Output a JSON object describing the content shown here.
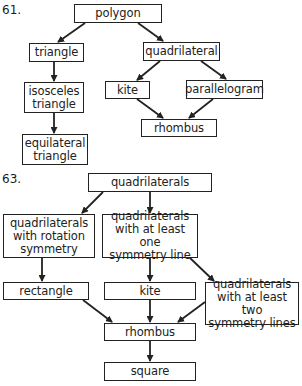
{
  "diagrams": [
    {
      "number": "61.",
      "nodes": {
        "polygon": "polygon",
        "triangle": "triangle",
        "quadrilateral": "quadrilateral",
        "isosceles_triangle": "isosceles\ntriangle",
        "kite": "kite",
        "parallelogram": "parallelogram",
        "rhombus": "rhombus",
        "equilateral_triangle": "equilateral\ntriangle"
      },
      "edges": [
        [
          "polygon",
          "triangle"
        ],
        [
          "polygon",
          "quadrilateral"
        ],
        [
          "triangle",
          "isosceles_triangle"
        ],
        [
          "isosceles_triangle",
          "equilateral_triangle"
        ],
        [
          "quadrilateral",
          "kite"
        ],
        [
          "quadrilateral",
          "parallelogram"
        ],
        [
          "kite",
          "rhombus"
        ],
        [
          "parallelogram",
          "rhombus"
        ]
      ]
    },
    {
      "number": "63.",
      "nodes": {
        "quadrilaterals": "quadrilaterals",
        "rotation_symmetry": "quadrilaterals\nwith rotation\nsymmetry",
        "one_symmetry_line": "quadrilaterals\nwith at least one\nsymmetry line",
        "rectangle": "rectangle",
        "kite": "kite",
        "two_symmetry_lines": "quadrilaterals\nwith at least two\nsymmetry lines",
        "rhombus": "rhombus",
        "square": "square"
      },
      "edges": [
        [
          "quadrilaterals",
          "rotation_symmetry"
        ],
        [
          "quadrilaterals",
          "one_symmetry_line"
        ],
        [
          "rotation_symmetry",
          "rectangle"
        ],
        [
          "one_symmetry_line",
          "kite"
        ],
        [
          "one_symmetry_line",
          "two_symmetry_lines"
        ],
        [
          "rectangle",
          "rhombus"
        ],
        [
          "kite",
          "rhombus"
        ],
        [
          "two_symmetry_lines",
          "rhombus"
        ],
        [
          "rhombus",
          "square"
        ]
      ]
    }
  ],
  "colors": {
    "line": "#222222",
    "background": "#ffffff"
  }
}
